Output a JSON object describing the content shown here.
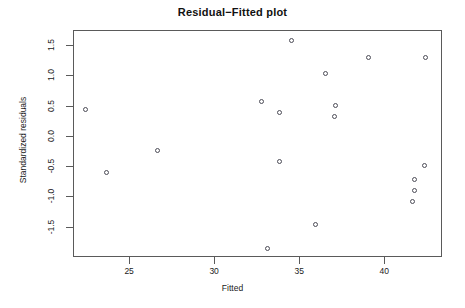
{
  "chart_data": {
    "type": "scatter",
    "title": "Residual−Fitted plot",
    "xlabel": "Fitted",
    "ylabel": "Standardized residuals",
    "xlim": [
      21.7,
      43.4
    ],
    "ylim": [
      -2.0,
      1.75
    ],
    "grid": false,
    "legend": null,
    "xticks": [
      25,
      30,
      35,
      40
    ],
    "xtick_labels": [
      "25",
      "30",
      "35",
      "40"
    ],
    "yticks": [
      1.5,
      1.0,
      0.5,
      0.0,
      -0.5,
      -1.0,
      -1.5
    ],
    "ytick_labels": [
      "1.5",
      "1.0",
      "0.5",
      "0.0",
      "-0.5",
      "-1.0",
      "-1.5"
    ],
    "marker": "open-circle",
    "marker_color": "#4c4c57",
    "points": [
      {
        "x": 22.4,
        "y": 0.45
      },
      {
        "x": 23.6,
        "y": -0.58
      },
      {
        "x": 26.6,
        "y": -0.22
      },
      {
        "x": 32.7,
        "y": 0.58
      },
      {
        "x": 33.1,
        "y": -1.84
      },
      {
        "x": 33.8,
        "y": 0.4
      },
      {
        "x": 33.8,
        "y": -0.41
      },
      {
        "x": 34.5,
        "y": 1.6
      },
      {
        "x": 35.9,
        "y": -1.45
      },
      {
        "x": 36.5,
        "y": 1.04
      },
      {
        "x": 37.0,
        "y": 0.33
      },
      {
        "x": 37.1,
        "y": 0.52
      },
      {
        "x": 39.0,
        "y": 1.32
      },
      {
        "x": 41.6,
        "y": -1.06
      },
      {
        "x": 41.7,
        "y": -0.88
      },
      {
        "x": 41.7,
        "y": -0.7
      },
      {
        "x": 42.3,
        "y": -0.47
      },
      {
        "x": 42.4,
        "y": 1.32
      }
    ]
  },
  "figure": {
    "background": "#ffffff",
    "frame_color": "#5a5a5a"
  }
}
